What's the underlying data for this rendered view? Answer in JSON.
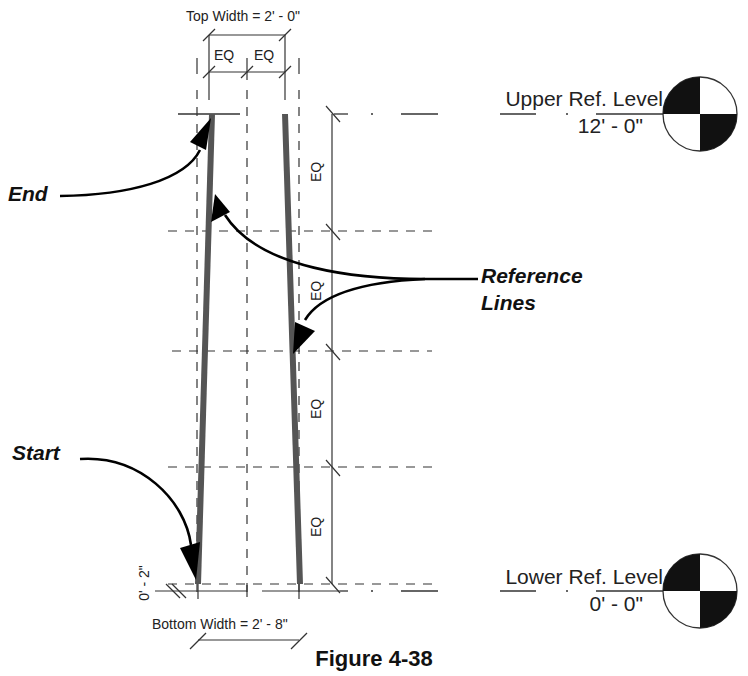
{
  "figure": {
    "caption": "Figure 4-38",
    "top_dimension": {
      "label": "Top Width = 2' - 0\"",
      "eq_left": "EQ",
      "eq_right": "EQ"
    },
    "bottom_dimension": {
      "label": "Bottom Width = 2' - 8\"",
      "offset": "0' - 2\""
    },
    "vertical_dimension": {
      "segments": [
        "EQ",
        "EQ",
        "EQ",
        "EQ"
      ]
    },
    "levels": [
      {
        "name": "Upper Ref. Level",
        "elevation": "12' - 0\""
      },
      {
        "name": "Lower Ref. Level",
        "elevation": "0' - 0\""
      }
    ],
    "callouts": {
      "end": "End",
      "reference_lines_1": "Reference",
      "reference_lines_2": "Lines",
      "start": "Start"
    },
    "colors": {
      "line": "#333333",
      "wall": "#555555",
      "leader": "#000000",
      "background": "#ffffff"
    }
  }
}
